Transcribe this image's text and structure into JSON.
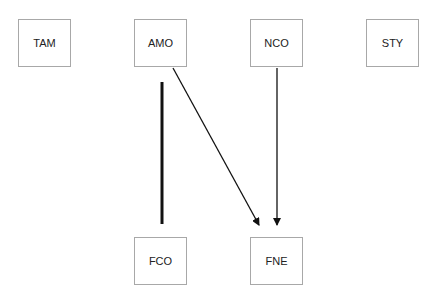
{
  "diagram": {
    "type": "directed-graph",
    "nodes": [
      {
        "id": "TAM",
        "label": "TAM",
        "x": 18,
        "y": 19
      },
      {
        "id": "AMO",
        "label": "AMO",
        "x": 134,
        "y": 19
      },
      {
        "id": "NCO",
        "label": "NCO",
        "x": 250,
        "y": 19
      },
      {
        "id": "STY",
        "label": "STY",
        "x": 366,
        "y": 19
      },
      {
        "id": "FCO",
        "label": "FCO",
        "x": 134,
        "y": 237
      },
      {
        "id": "FNE",
        "label": "FNE",
        "x": 250,
        "y": 237
      }
    ],
    "edges": [
      {
        "from": "unknown",
        "to": "FCO",
        "style": "thick-undirected",
        "note": "standalone vertical line above FCO"
      },
      {
        "from": "AMO",
        "to": "FNE",
        "style": "arrow"
      },
      {
        "from": "NCO",
        "to": "FNE",
        "style": "arrow"
      }
    ],
    "colors": {
      "node_border": "#a8a8a8",
      "edge": "#111111",
      "text": "#222222"
    }
  }
}
